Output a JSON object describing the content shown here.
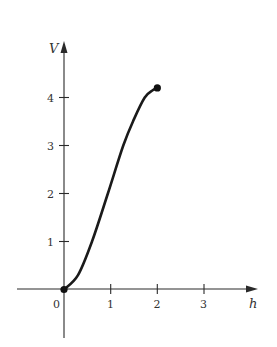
{
  "chart_data": {
    "type": "line",
    "title": "",
    "xlabel": "h",
    "ylabel": "V",
    "xlim": [
      -1,
      3.5
    ],
    "ylim": [
      -1,
      5
    ],
    "grid": false,
    "legend": null,
    "x_ticks": [
      1,
      2,
      3
    ],
    "y_ticks": [
      1,
      2,
      3,
      4
    ],
    "origin_label": "0",
    "series": [
      {
        "name": "V(h)",
        "x": [
          0,
          0.3,
          0.6,
          0.94,
          1.27,
          1.5,
          1.73,
          1.9,
          2.0
        ],
        "y": [
          0,
          0.3,
          1.0,
          2.0,
          3.0,
          3.55,
          4.0,
          4.15,
          4.2
        ]
      }
    ],
    "endpoints": [
      {
        "x": 0,
        "y": 0,
        "filled": true
      },
      {
        "x": 2,
        "y": 4.2,
        "filled": true
      }
    ]
  },
  "labels": {
    "x_axis": "h",
    "y_axis": "V",
    "origin": "0",
    "x_tick_1": "1",
    "x_tick_2": "2",
    "x_tick_3": "3",
    "y_tick_1": "1",
    "y_tick_2": "2",
    "y_tick_3": "3",
    "y_tick_4": "4"
  }
}
